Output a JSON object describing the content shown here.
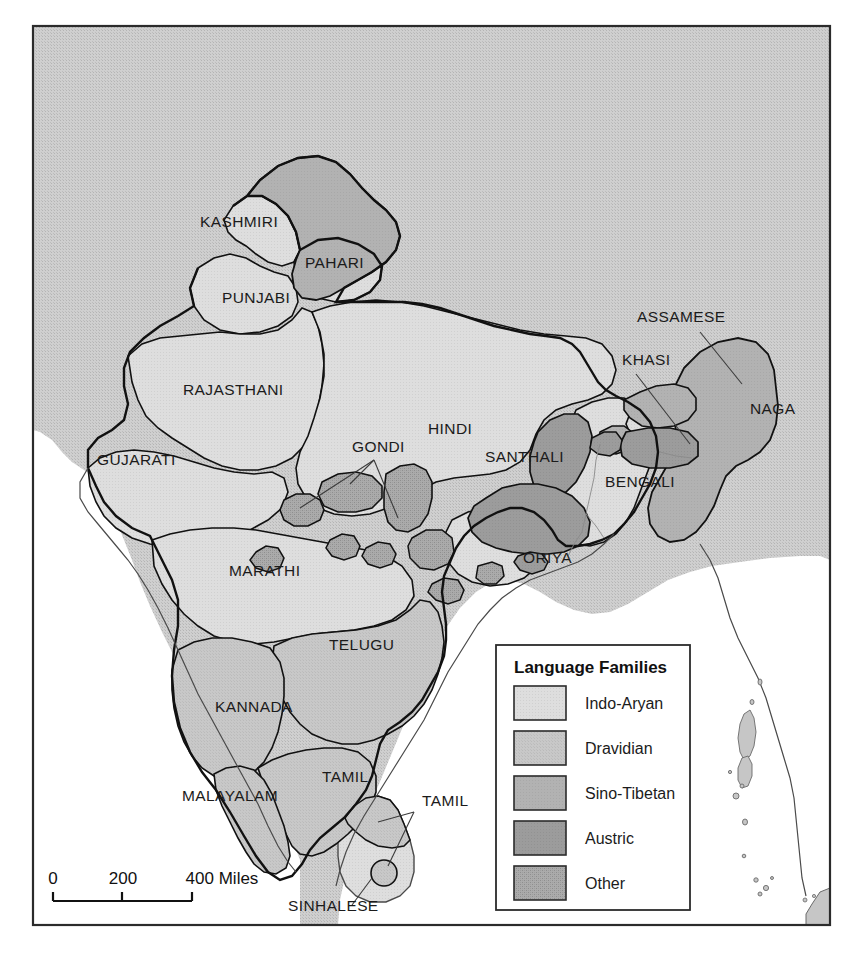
{
  "map": {
    "title": "Language Families of South Asia",
    "frame": {
      "border_color": "#2b2b2b"
    },
    "colors": {
      "page_background": "#ffffff",
      "ocean": "#ffffff",
      "neighbor_land": "#c9c9c9",
      "indo_aryan": "#dcdcdc",
      "dravidian": "#c6c6c6",
      "sino_tibetan": "#b0b0b0",
      "austric": "#9a9a9a",
      "other": "#a3a3a3",
      "boundary": "#111111",
      "coastline": "#4a4a4a",
      "label_text": "#1b1b1b"
    },
    "labels": [
      {
        "text": "KASHMIRI",
        "x": 200,
        "y": 227,
        "family": "indo_aryan"
      },
      {
        "text": "PAHARI",
        "x": 305,
        "y": 268,
        "family": "indo_aryan"
      },
      {
        "text": "PUNJABI",
        "x": 222,
        "y": 303,
        "family": "indo_aryan"
      },
      {
        "text": "RAJASTHANI",
        "x": 183,
        "y": 395,
        "family": "indo_aryan"
      },
      {
        "text": "GUJARATI",
        "x": 97,
        "y": 465,
        "family": "indo_aryan"
      },
      {
        "text": "HINDI",
        "x": 428,
        "y": 434,
        "family": "indo_aryan"
      },
      {
        "text": "GONDI",
        "x": 352,
        "y": 452,
        "family": "other"
      },
      {
        "text": "SANTHALI",
        "x": 485,
        "y": 462,
        "family": "austric"
      },
      {
        "text": "BENGALI",
        "x": 605,
        "y": 487,
        "family": "indo_aryan"
      },
      {
        "text": "ASSAMESE",
        "x": 637,
        "y": 322,
        "family": "indo_aryan"
      },
      {
        "text": "KHASI",
        "x": 622,
        "y": 365,
        "family": "austric"
      },
      {
        "text": "NAGA",
        "x": 750,
        "y": 414,
        "family": "sino_tibetan"
      },
      {
        "text": "ORIYA",
        "x": 523,
        "y": 563,
        "family": "indo_aryan"
      },
      {
        "text": "MARATHI",
        "x": 229,
        "y": 576,
        "family": "indo_aryan"
      },
      {
        "text": "TELUGU",
        "x": 329,
        "y": 650,
        "family": "dravidian"
      },
      {
        "text": "KANNADA",
        "x": 215,
        "y": 712,
        "family": "dravidian"
      },
      {
        "text": "TAMIL",
        "x": 322,
        "y": 782,
        "family": "dravidian"
      },
      {
        "text": "MALAYALAM",
        "x": 182,
        "y": 801,
        "family": "dravidian"
      },
      {
        "text": "TAMIL",
        "x": 422,
        "y": 806,
        "family": "dravidian"
      },
      {
        "text": "SINHALESE",
        "x": 288,
        "y": 911,
        "family": "indo_aryan"
      }
    ],
    "scale_bar": {
      "ticks": [
        "0",
        "200",
        "400 Miles"
      ],
      "unit": "Miles"
    },
    "legend": {
      "title": "Language Families",
      "items": [
        {
          "label": "Indo-Aryan",
          "color": "#dcdcdc",
          "pattern": "plain"
        },
        {
          "label": "Dravidian",
          "color": "#c6c6c6",
          "pattern": "fine-dot"
        },
        {
          "label": "Sino-Tibetan",
          "color": "#b0b0b0",
          "pattern": "plain"
        },
        {
          "label": "Austric",
          "color": "#9a9a9a",
          "pattern": "plain"
        },
        {
          "label": "Other",
          "color": "#a3a3a3",
          "pattern": "cross-dot"
        }
      ]
    }
  }
}
